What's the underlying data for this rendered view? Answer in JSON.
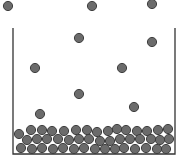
{
  "diagram": {
    "colors": {
      "background": "#ffffff",
      "container_stroke": "#333333",
      "particle_fill": "#6b6b6b",
      "particle_stroke": "#3f3f3f"
    },
    "container": {
      "left": 13,
      "right": 175,
      "top": 28,
      "bottom": 154
    },
    "particle_radius": 4.6,
    "free_particles": [
      {
        "x": 8,
        "y": 6
      },
      {
        "x": 92,
        "y": 6
      },
      {
        "x": 152,
        "y": 4
      },
      {
        "x": 79,
        "y": 38
      },
      {
        "x": 152,
        "y": 42
      },
      {
        "x": 35,
        "y": 68
      },
      {
        "x": 122,
        "y": 68
      },
      {
        "x": 79,
        "y": 94
      },
      {
        "x": 134,
        "y": 107
      },
      {
        "x": 40,
        "y": 114
      }
    ],
    "settled_particles": [
      {
        "x": 19,
        "y": 134
      },
      {
        "x": 31,
        "y": 130
      },
      {
        "x": 42,
        "y": 130
      },
      {
        "x": 52,
        "y": 131
      },
      {
        "x": 64,
        "y": 131
      },
      {
        "x": 76,
        "y": 130
      },
      {
        "x": 87,
        "y": 130
      },
      {
        "x": 97,
        "y": 132
      },
      {
        "x": 108,
        "y": 131
      },
      {
        "x": 117,
        "y": 129
      },
      {
        "x": 126,
        "y": 130
      },
      {
        "x": 137,
        "y": 131
      },
      {
        "x": 147,
        "y": 131
      },
      {
        "x": 158,
        "y": 130
      },
      {
        "x": 168,
        "y": 129
      },
      {
        "x": 27,
        "y": 140
      },
      {
        "x": 37,
        "y": 139
      },
      {
        "x": 47,
        "y": 139
      },
      {
        "x": 58,
        "y": 139
      },
      {
        "x": 69,
        "y": 140
      },
      {
        "x": 79,
        "y": 139
      },
      {
        "x": 89,
        "y": 139
      },
      {
        "x": 100,
        "y": 141
      },
      {
        "x": 110,
        "y": 141
      },
      {
        "x": 120,
        "y": 139
      },
      {
        "x": 130,
        "y": 139
      },
      {
        "x": 140,
        "y": 139
      },
      {
        "x": 151,
        "y": 139
      },
      {
        "x": 160,
        "y": 140
      },
      {
        "x": 169,
        "y": 139
      },
      {
        "x": 21,
        "y": 148
      },
      {
        "x": 32,
        "y": 149
      },
      {
        "x": 42,
        "y": 148
      },
      {
        "x": 53,
        "y": 149
      },
      {
        "x": 63,
        "y": 148
      },
      {
        "x": 74,
        "y": 149
      },
      {
        "x": 84,
        "y": 148
      },
      {
        "x": 95,
        "y": 149
      },
      {
        "x": 105,
        "y": 149
      },
      {
        "x": 115,
        "y": 149
      },
      {
        "x": 124,
        "y": 148
      },
      {
        "x": 135,
        "y": 149
      },
      {
        "x": 146,
        "y": 148
      },
      {
        "x": 157,
        "y": 149
      },
      {
        "x": 166,
        "y": 149
      }
    ]
  }
}
